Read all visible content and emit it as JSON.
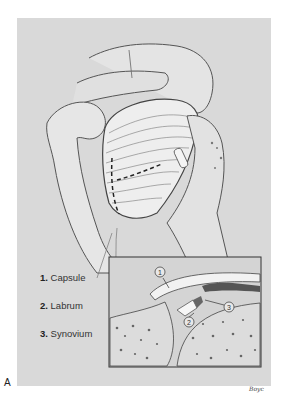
{
  "figure": {
    "panel_label": "A",
    "signature": "Boyc",
    "legend": [
      {
        "number": "1.",
        "label": "Capsule"
      },
      {
        "number": "2.",
        "label": "Labrum"
      },
      {
        "number": "3.",
        "label": "Synovium"
      }
    ],
    "callouts": [
      "1",
      "2",
      "3"
    ],
    "colors": {
      "background": "#d9d9d9",
      "ink": "#3a3a3a",
      "bone": "#e8e8e8"
    }
  }
}
